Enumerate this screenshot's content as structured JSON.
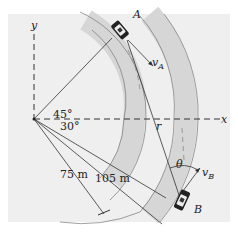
{
  "diagram": {
    "axes": {
      "x_label": "x",
      "y_label": "y"
    },
    "cars": {
      "A": {
        "label": "A",
        "velocity_label": "v",
        "velocity_subscript": "A"
      },
      "B": {
        "label": "B",
        "velocity_label": "v",
        "velocity_subscript": "B"
      }
    },
    "angles": {
      "angle_A": "45°",
      "angle_B": "30°",
      "theta": "θ"
    },
    "radii": {
      "inner": "75 m",
      "outer": "105 m"
    },
    "relative_position_label": "r",
    "colors": {
      "road": "#d9d9d9",
      "background": "#efefef",
      "line": "#333333"
    }
  }
}
